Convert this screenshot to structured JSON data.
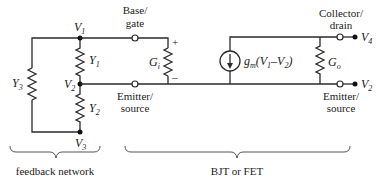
{
  "diagram": {
    "nodes": {
      "v1": {
        "label": "V",
        "sub": "1"
      },
      "v2": {
        "label": "V",
        "sub": "2"
      },
      "v3": {
        "label": "V",
        "sub": "3"
      },
      "v4": {
        "label": "V",
        "sub": "4"
      },
      "v2_out": {
        "label": "V",
        "sub": "2"
      }
    },
    "components": {
      "y1": {
        "label": "Y",
        "sub": "1"
      },
      "y2": {
        "label": "Y",
        "sub": "2"
      },
      "y3": {
        "label": "Y",
        "sub": "3"
      },
      "gi": {
        "label": "G",
        "sub": "i",
        "plus": "+",
        "minus": "–"
      },
      "go": {
        "label": "G",
        "sub": "o"
      },
      "gm": {
        "label": "g",
        "sub": "m",
        "expr": "(V",
        "sub1": "1",
        "mid": "–V",
        "sub2": "2",
        "close": ")"
      }
    },
    "terminals": {
      "base_gate_1": "Base/",
      "base_gate_2": "gate",
      "emitter_source_left_1": "Emitter/",
      "emitter_source_left_2": "source",
      "collector_drain_1": "Collector/",
      "collector_drain_2": "drain",
      "emitter_source_right_1": "Emitter/",
      "emitter_source_right_2": "source"
    },
    "groups": {
      "feedback": "feedback network",
      "device": "BJT or FET"
    }
  }
}
